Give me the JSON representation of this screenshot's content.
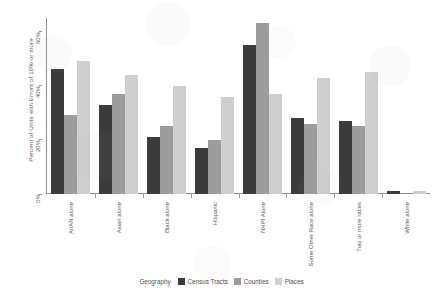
{
  "chart_data": {
    "type": "bar",
    "title": "",
    "xlabel": "",
    "ylabel": "Percent of Units with Errors of 10% or more",
    "ylim": [
      0,
      65
    ],
    "yticks": [
      "0%",
      "20%",
      "40%",
      "60%"
    ],
    "ytick_values": [
      0,
      20,
      40,
      60
    ],
    "grid": false,
    "legend_position": "bottom",
    "legend_title": "Geography",
    "categories": [
      "AI/AN alone",
      "Asian alone",
      "Black alone",
      "Hispanic",
      "NHPI Alone",
      "Some Other Race alone",
      "Two or more races",
      "White alone"
    ],
    "series": [
      {
        "name": "Census Tracts",
        "color": "#3b3b3b",
        "values": [
          46,
          33,
          21,
          17,
          55,
          28,
          27,
          1
        ]
      },
      {
        "name": "Counties",
        "color": "#9d9d9d",
        "values": [
          29,
          37,
          25,
          20,
          63,
          26,
          25,
          0
        ]
      },
      {
        "name": "Places",
        "color": "#cfcfcf",
        "values": [
          49,
          44,
          40,
          36,
          37,
          43,
          45,
          1
        ]
      }
    ]
  },
  "legend": {
    "title": "Geography",
    "items": [
      {
        "label": "Census Tracts",
        "color": "#3b3b3b"
      },
      {
        "label": "Counties",
        "color": "#9d9d9d"
      },
      {
        "label": "Places",
        "color": "#cfcfcf"
      }
    ]
  }
}
